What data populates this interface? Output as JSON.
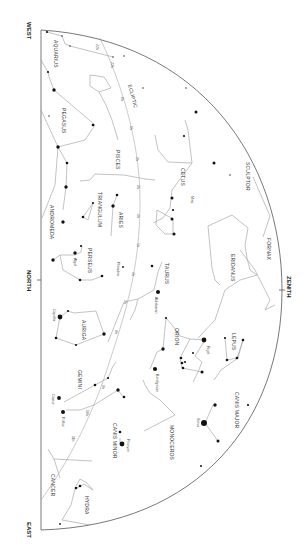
{
  "map": {
    "title": "Star Chart",
    "orientation": "rotated-90-cw",
    "directions": {
      "west": "WEST",
      "north": "NORTH",
      "east": "EAST",
      "zenith": "ZENITH"
    },
    "ecliptic_label": "ECLIPTIC",
    "ecliptic_marks": [
      "1h",
      "2h",
      "3h",
      "4h",
      "5h",
      "6h",
      "7h",
      "8h",
      "9h",
      "10h",
      "11h",
      "22h",
      "23h",
      "0h"
    ],
    "constellations": {
      "aquarius": "AQUARIUS",
      "pegasus": "PEGASUS",
      "pisces": "PISCES",
      "cetus": "CETUS",
      "sculptor": "SCULPTOR",
      "fornax": "FORNAX",
      "andromeda": "ANDROMEDA",
      "triangulum": "TRIANGULUM",
      "aries": "ARIES",
      "perseus": "PERSEUS",
      "taurus": "TAURUS",
      "eridanus": "ERIDANUS",
      "auriga": "AURIGA",
      "orion": "ORION",
      "lepus": "LEPUS",
      "gemini": "GEMINI",
      "canis_major": "CANIS MAJOR",
      "canis_minor": "CANIS MINOR",
      "monoceros": "MONOCEROS",
      "cancer": "CANCER",
      "hydra": "HYDRA"
    },
    "stars": {
      "mira": "Mira",
      "algol": "Algol",
      "pleiades": "Pleiades",
      "aldebaran": "Aldebaran",
      "capella": "Capella",
      "rigel": "Rigel",
      "betelgeuse": "Betelgeuse",
      "castor": "Castor",
      "pollux": "Pollux",
      "procyon": "Procyon",
      "sirius": "Sirius"
    },
    "colors": {
      "background": "#ffffff",
      "stars": "#111111",
      "lines": "#9a9a9a",
      "horizon": "#555555"
    }
  }
}
